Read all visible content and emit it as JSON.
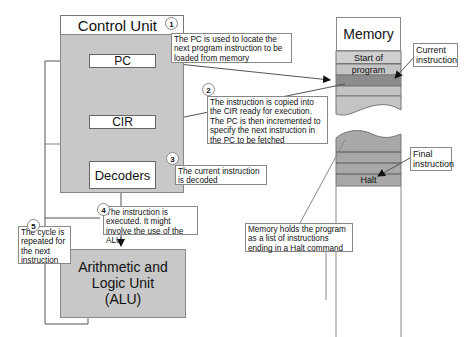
{
  "control_unit": {
    "title": "Control Unit",
    "registers": {
      "pc": "PC",
      "cir": "CIR",
      "decoders": "Decoders"
    }
  },
  "alu": {
    "line1": "Arithmetic and",
    "line2": "Logic Unit",
    "line3": "(ALU)"
  },
  "memory": {
    "title": "Memory",
    "start_label": "Start of program",
    "halt_label": "Halt",
    "current_instruction_label": "Current instruction",
    "final_instruction_label": "Final instruction",
    "note": "Memory holds the program as a list of instructions ending in a Halt command"
  },
  "steps": [
    {
      "number": "1",
      "text": "The PC is used to locate the next program instruction to be loaded from memory"
    },
    {
      "number": "2",
      "text": "The instruction is copied into the CIR ready for execution. The PC is then incremented to specify the next instruction in the PC to be fetched"
    },
    {
      "number": "3",
      "text": "The current instruction is decoded"
    },
    {
      "number": "4",
      "text": "The instruction is executed. It might involve the use of the ALU"
    },
    {
      "number": "5",
      "text": "The cycle is repeated for the next instruction"
    }
  ],
  "colors": {
    "unit_fill": "#c8c8c8",
    "memory_fill": "#bdbdbd",
    "current_band": "#8c8c8c"
  }
}
